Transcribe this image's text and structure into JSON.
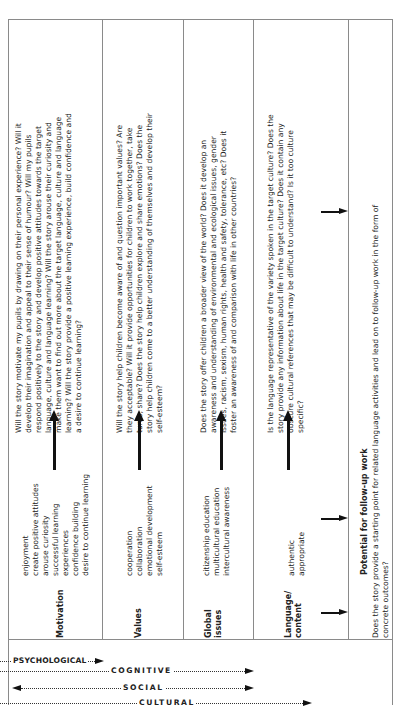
{
  "figure": {
    "orientation": "rotated 90° counter-clockwise",
    "rows": [
      {
        "label": "Motivation",
        "items": [
          "enjoyment",
          "create positive attitudes",
          "arouse curiosity",
          "successful learning",
          "experiences",
          "confidence building",
          "desire to continue learning"
        ],
        "question_lines": [
          "Will the story motivate my pupils by drawing on their personal experience? Will it",
          "develop their imagination and appeal to their sense of humour? Will my pupils",
          "respond positively to the story and develop positive attitudes towards the target",
          "language, culture and language learning? Will the story arouse their curiosity and",
          "make them want to find out more about the target language, culture and language",
          "learning? Will the story provide a positive learning experience, build confidence and",
          "a desire to continue learning?"
        ]
      },
      {
        "label": "Values",
        "items": [
          "cooperation",
          "collaboration",
          "emotional development",
          "self-esteem"
        ],
        "question_lines": [
          "Will the story help children become aware of and question important values? Are",
          "they acceptable? Will it provide opportunities for children to work together, take",
          "turns, share? Does the story help children explore and share emotions? Does the",
          "story help children come to a better understanding of themselves and develop their",
          "self-esteem?"
        ]
      },
      {
        "label_lines": [
          "Global",
          "issues"
        ],
        "label": "Global issues",
        "items": [
          "citizenship education",
          "multicultural education",
          "intercultural awareness"
        ],
        "question_lines": [
          "Does the story offer children a broader view of the world? Does it develop an",
          "awareness and understanding of environmental and ecological issues, gender",
          "issues, racism, sexism, human rights, health and safety, tolerance, etc? Does it",
          "foster an awareness of and comparison with life in other countries?"
        ]
      },
      {
        "label_lines": [
          "Language/",
          "content"
        ],
        "label": "Language/ content",
        "items": [
          "authentic",
          "appropriate"
        ],
        "question_lines": [
          "Is the language representative of the variety spoken in the target culture? Does the",
          "story provide any information about life in the target culture? Does it contain any",
          "obscure cultural references that may be difficult to understand? Is it too culture",
          "specific?"
        ]
      }
    ],
    "follow_up": {
      "title": "Potential for follow-up work",
      "question_lines": [
        "Does the story provide a starting point for related language activities and lead on to follow-up work in the form of",
        "concrete outcomes?"
      ]
    },
    "dimensions": [
      {
        "label": "PSYCHOLOGICAL",
        "direction": "right"
      },
      {
        "label": "COGNITIVE",
        "direction": "right"
      },
      {
        "label": "SOCIAL",
        "direction": "both"
      },
      {
        "label": "CULTURAL",
        "direction": "right"
      }
    ]
  }
}
